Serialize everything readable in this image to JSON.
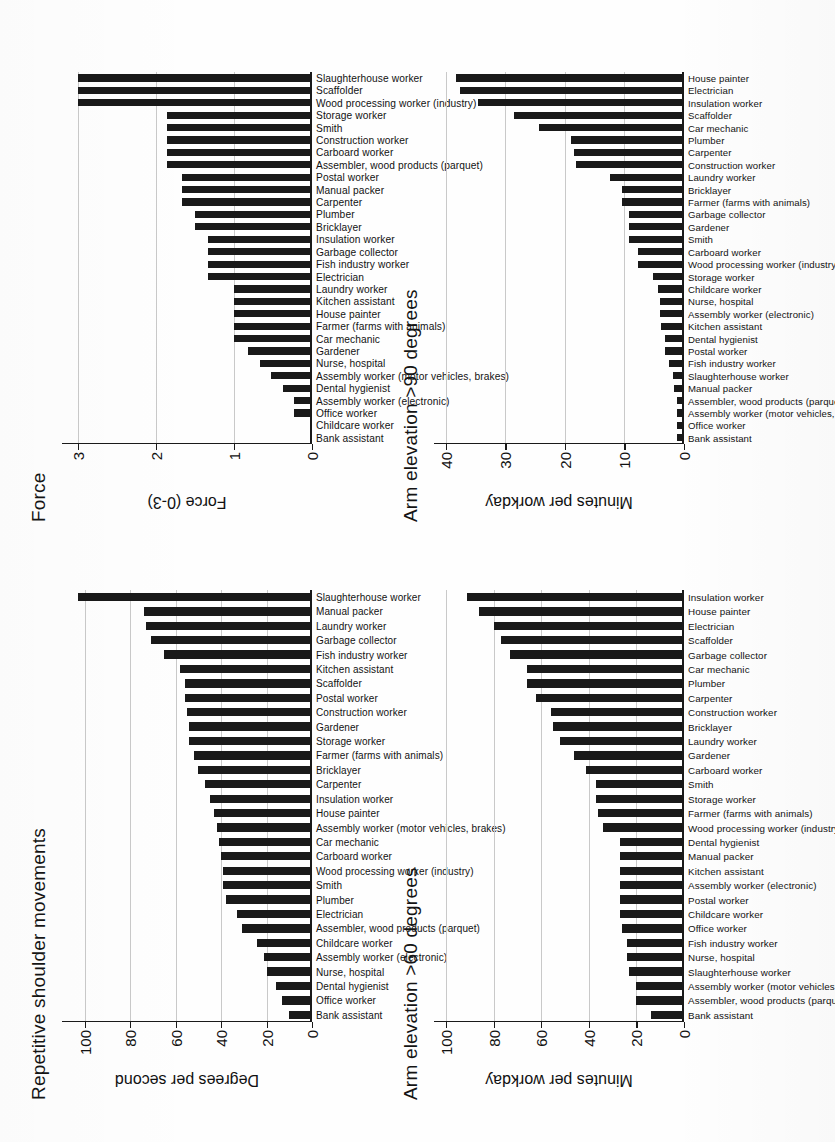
{
  "figure": {
    "kind": "scanned-journal-figure",
    "orientation": "rotated-90-ccw",
    "panel_count": 4
  },
  "chart_data": [
    {
      "id": "force",
      "type": "bar",
      "title": "Force",
      "xlabel": "",
      "ylabel": "Force (0-3)",
      "ylim": [
        0,
        3.2
      ],
      "yticks": [
        0,
        1,
        2,
        3
      ],
      "ytick_labels": [
        "0",
        "1",
        "2",
        "3"
      ],
      "grid": true,
      "legend": "none",
      "categories": [
        "Bank assistant",
        "Childcare worker",
        "Office worker",
        "Assembly worker (electronic)",
        "Dental hygienist",
        "Assembly worker (motor vehicles, brakes)",
        "Nurse, hospital",
        "Gardener",
        "Car mechanic",
        "Farmer (farms with animals)",
        "House painter",
        "Kitchen assistant",
        "Laundry worker",
        "Electrician",
        "Fish industry worker",
        "Garbage collector",
        "Insulation worker",
        "Bricklayer",
        "Plumber",
        "Carpenter",
        "Manual packer",
        "Postal worker",
        "Assembler, wood products (parquet)",
        "Carboard worker",
        "Construction worker",
        "Smith",
        "Storage worker",
        "Wood processing worker (industry)",
        "Scaffolder",
        "Slaughterhouse worker"
      ],
      "values": [
        0,
        0,
        0.23,
        0.23,
        0.37,
        0.52,
        0.66,
        0.82,
        1.0,
        1.0,
        1.0,
        1.0,
        1.0,
        1.33,
        1.33,
        1.33,
        1.33,
        1.5,
        1.5,
        1.66,
        1.66,
        1.66,
        1.85,
        1.85,
        1.85,
        1.85,
        1.85,
        3.0,
        3.0,
        3.0
      ]
    },
    {
      "id": "arm90",
      "type": "bar",
      "title": "Arm elevation >90 degrees",
      "xlabel": "",
      "ylabel": "Minutes per workday",
      "ylim": [
        0,
        42
      ],
      "yticks": [
        0,
        10,
        20,
        30,
        40
      ],
      "ytick_labels": [
        "0",
        "10",
        "20",
        "30",
        "40"
      ],
      "grid": true,
      "legend": "none",
      "categories": [
        "Bank assistant",
        "Office worker",
        "Assembly worker (motor vehicles, brakes)",
        "Assembler, wood products (parquet)",
        "Manual packer",
        "Slaughterhouse worker",
        "Fish industry worker",
        "Postal worker",
        "Dental hygienist",
        "Kitchen assistant",
        "Assembly worker (electronic)",
        "Nurse, hospital",
        "Childcare worker",
        "Storage worker",
        "Wood processing worker (industry)",
        "Carboard worker",
        "Smith",
        "Gardener",
        "Garbage collector",
        "Farmer (farms with animals)",
        "Bricklayer",
        "Laundry worker",
        "Construction worker",
        "Carpenter",
        "Plumber",
        "Car mechanic",
        "Scaffolder",
        "Insulation worker",
        "Electrician",
        "House painter"
      ],
      "values": [
        1.2,
        1.2,
        1.2,
        1.2,
        1.6,
        1.8,
        2.5,
        3.2,
        3.2,
        3.8,
        4.0,
        4.0,
        4.4,
        5.2,
        7.7,
        7.7,
        9.3,
        9.3,
        9.3,
        10.4,
        10.4,
        12.5,
        18.2,
        18.4,
        19.0,
        24.3,
        28.6,
        34.6,
        37.7,
        38.3
      ]
    },
    {
      "id": "repetitive",
      "type": "bar",
      "title": "Repetitive shoulder movements",
      "xlabel": "",
      "ylabel": "Degrees per second",
      "ylim": [
        0,
        110
      ],
      "yticks": [
        0,
        20,
        40,
        60,
        80,
        100
      ],
      "ytick_labels": [
        "0",
        "20",
        "40",
        "60",
        "80",
        "100"
      ],
      "grid": true,
      "legend": "none",
      "categories": [
        "Bank assistant",
        "Office worker",
        "Dental hygienist",
        "Nurse, hospital",
        "Assembly worker (electronic)",
        "Childcare worker",
        "Assembler, wood products (parquet)",
        "Electrician",
        "Plumber",
        "Smith",
        "Wood processing worker (industry)",
        "Carboard worker",
        "Car mechanic",
        "Assembly worker (motor vehicles, brakes)",
        "House painter",
        "Insulation worker",
        "Carpenter",
        "Bricklayer",
        "Farmer (farms with animals)",
        "Storage worker",
        "Gardener",
        "Construction worker",
        "Postal worker",
        "Scaffolder",
        "Kitchen assistant",
        "Fish industry worker",
        "Garbage collector",
        "Laundry worker",
        "Manual packer",
        "Slaughterhouse worker"
      ],
      "values": [
        10,
        13,
        16,
        20,
        21,
        24,
        31,
        33,
        38,
        39,
        39,
        40,
        41,
        42,
        43,
        45,
        47,
        50,
        52,
        54,
        54,
        55,
        56,
        56,
        58,
        65,
        71,
        73,
        74,
        103
      ]
    },
    {
      "id": "arm60",
      "type": "bar",
      "title": "Arm elevation >60 degrees",
      "xlabel": "",
      "ylabel": "Minutes per workday",
      "ylim": [
        0,
        105
      ],
      "yticks": [
        0,
        20,
        40,
        60,
        80,
        100
      ],
      "ytick_labels": [
        "0",
        "20",
        "40",
        "60",
        "80",
        "100"
      ],
      "grid": true,
      "legend": "none",
      "categories": [
        "Bank assistant",
        "Assembler, wood products (parquet)",
        "Assembly worker (motor vehicles, brakes)",
        "Slaughterhouse worker",
        "Nurse, hospital",
        "Fish industry worker",
        "Office worker",
        "Childcare worker",
        "Postal worker",
        "Assembly worker (electronic)",
        "Kitchen assistant",
        "Manual packer",
        "Dental hygienist",
        "Wood processing worker (industry)",
        "Farmer (farms with animals)",
        "Storage worker",
        "Smith",
        "Carboard worker",
        "Gardener",
        "Laundry worker",
        "Bricklayer",
        "Construction worker",
        "Carpenter",
        "Plumber",
        "Car mechanic",
        "Garbage collector",
        "Scaffolder",
        "Electrician",
        "House painter",
        "Insulation worker"
      ],
      "values": [
        14,
        20,
        20,
        23,
        24,
        24,
        26,
        27,
        27,
        27,
        27,
        27,
        27,
        34,
        36,
        37,
        37,
        41,
        46,
        52,
        55,
        56,
        62,
        66,
        66,
        73,
        77,
        80,
        86,
        91
      ]
    }
  ]
}
